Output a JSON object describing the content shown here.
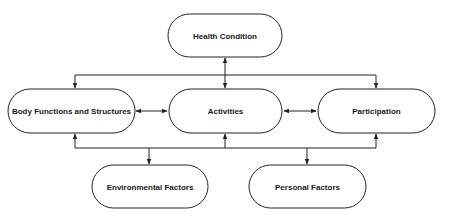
{
  "diagram": {
    "type": "flowchart",
    "nodes": [
      {
        "id": "health",
        "label": "Health Condition"
      },
      {
        "id": "body",
        "label": "Body Functions and Structures"
      },
      {
        "id": "activities",
        "label": "Activities"
      },
      {
        "id": "participation",
        "label": "Participation"
      },
      {
        "id": "environmental",
        "label": "Environmental Factors"
      },
      {
        "id": "personal",
        "label": "Personal Factors"
      }
    ],
    "edges": [
      {
        "from": "health",
        "to": "body",
        "direction": "both"
      },
      {
        "from": "health",
        "to": "activities",
        "direction": "both"
      },
      {
        "from": "health",
        "to": "participation",
        "direction": "both"
      },
      {
        "from": "body",
        "to": "activities",
        "direction": "both"
      },
      {
        "from": "activities",
        "to": "participation",
        "direction": "both"
      },
      {
        "from": "environmental",
        "to": "body",
        "direction": "both"
      },
      {
        "from": "environmental",
        "to": "activities",
        "direction": "both"
      },
      {
        "from": "environmental",
        "to": "participation",
        "direction": "both"
      },
      {
        "from": "personal",
        "to": "body",
        "direction": "both"
      },
      {
        "from": "personal",
        "to": "activities",
        "direction": "both"
      },
      {
        "from": "personal",
        "to": "participation",
        "direction": "both"
      }
    ],
    "colors": {
      "stroke": "#222222",
      "fill": "#ffffff",
      "text": "#1a1a1a"
    }
  }
}
